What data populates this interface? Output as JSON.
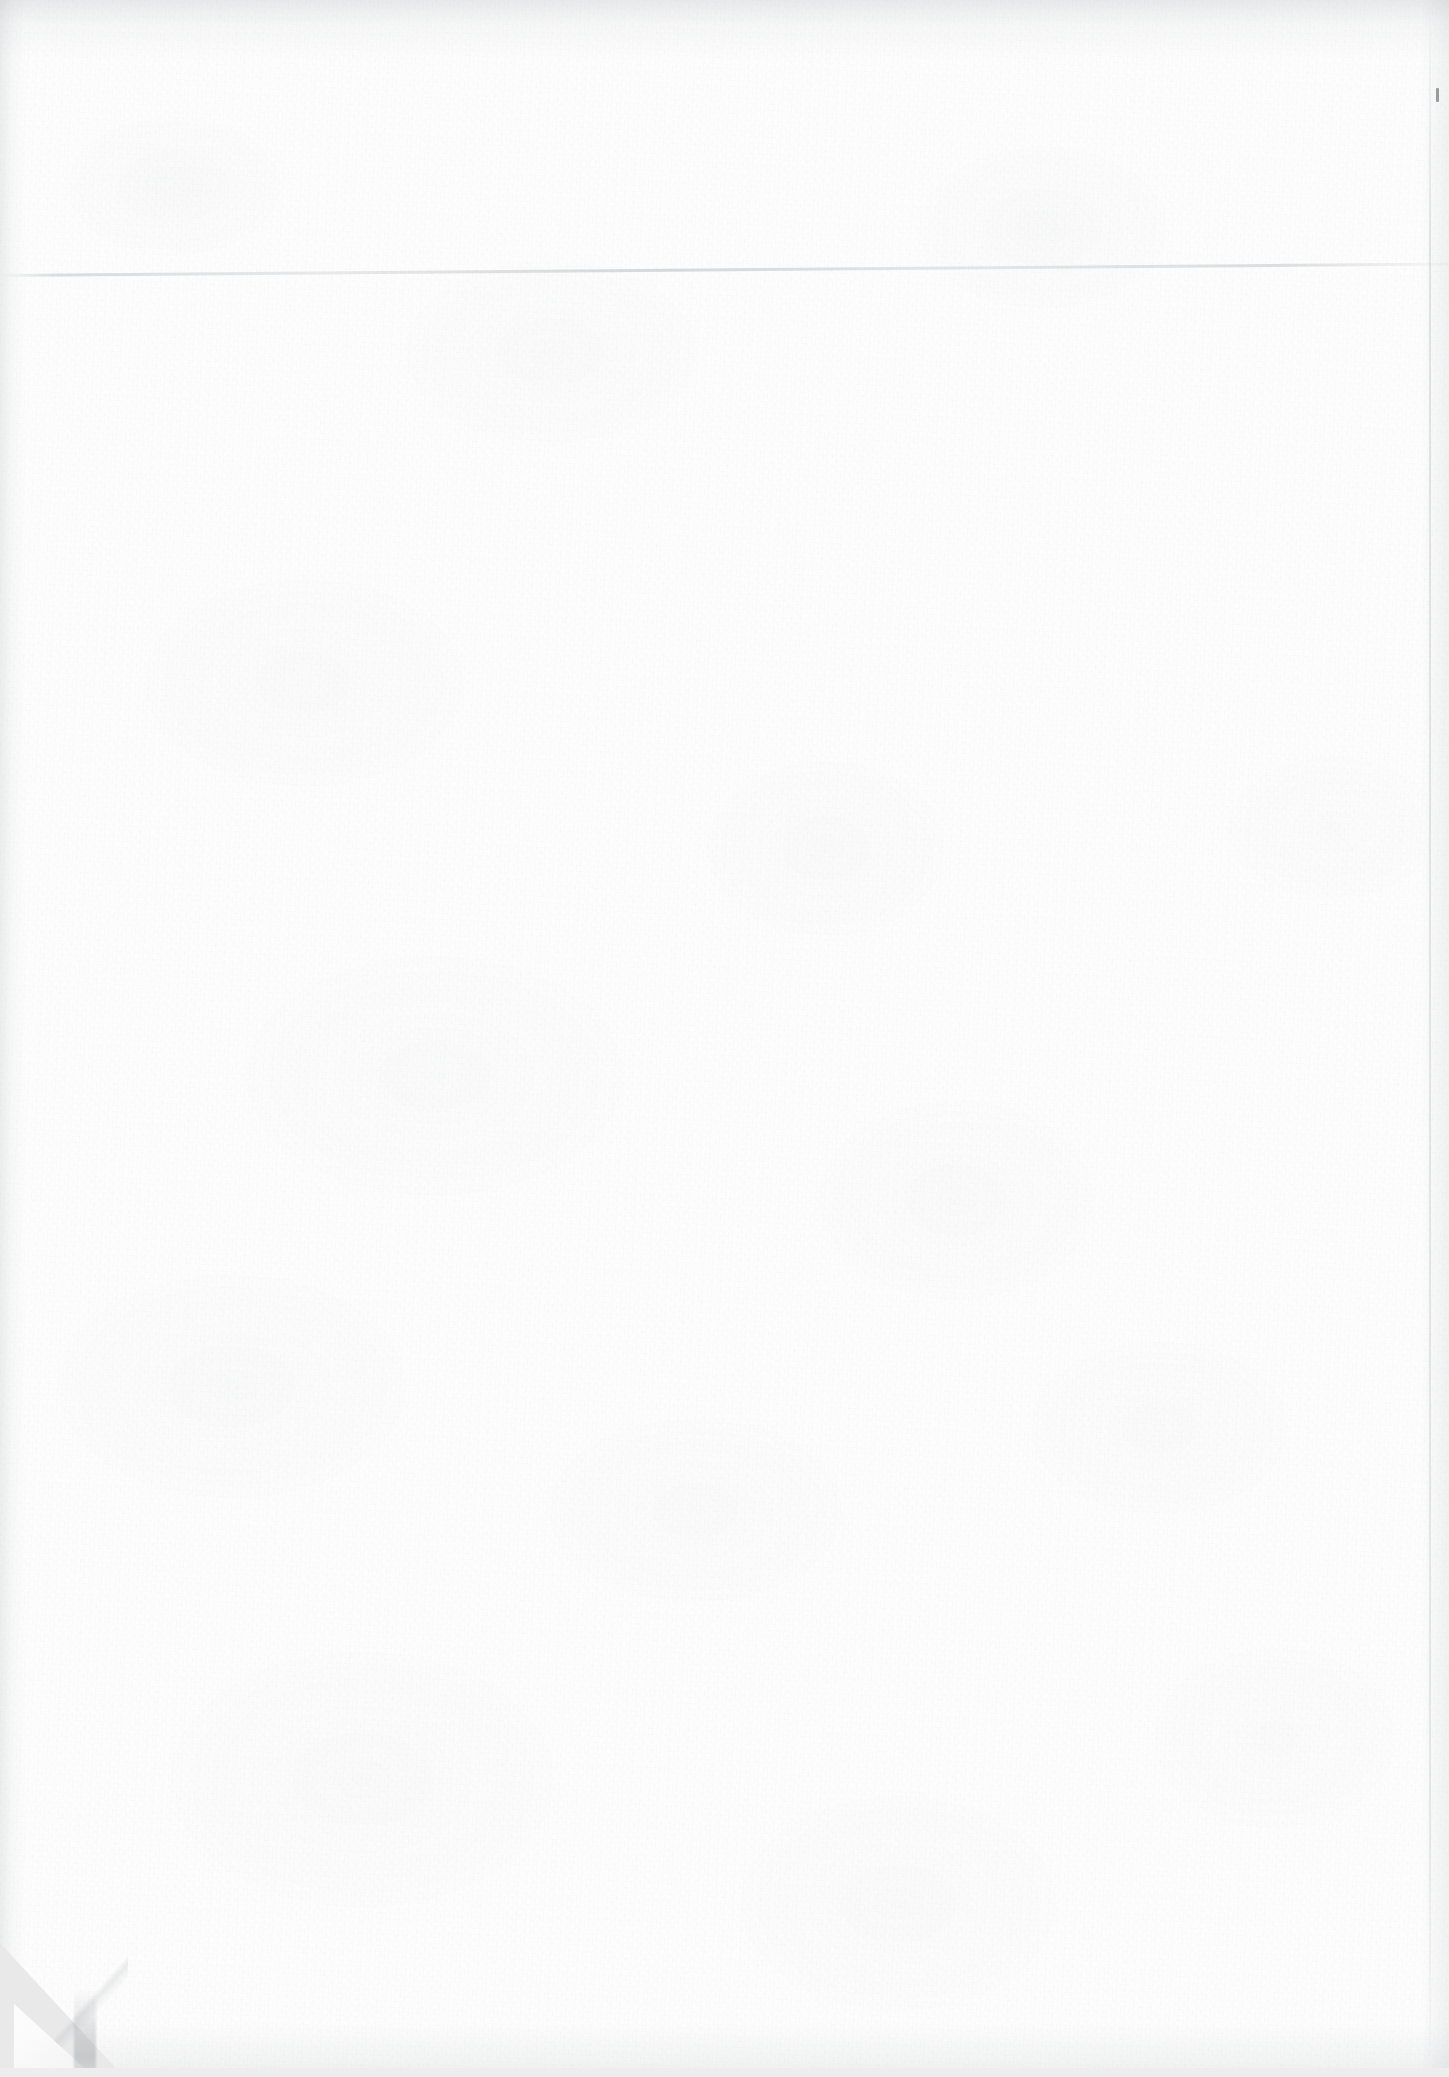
{
  "page": {
    "kind": "scanned-blank-page",
    "visible_text": "",
    "width_px": 1449,
    "height_px": 2077
  },
  "colors": {
    "paper": "#fdfdfd",
    "paper_shadow": "#f2f2f2",
    "scanner_backdrop": "#e9e9e9",
    "backdrop_strip": "#ededed",
    "edge_shade": "#8a9096",
    "speck": "#60646a"
  },
  "artifacts": {
    "grain": {
      "name": "paper-grain-texture",
      "label": ""
    },
    "mottle": {
      "name": "paper-mottling",
      "label": ""
    },
    "crease": {
      "name": "horizontal-paper-crease",
      "label": "",
      "top_px": 274
    },
    "speck": {
      "name": "ink-speck",
      "label": "",
      "left_px": 1436,
      "top_px": 88
    },
    "dog_ear": {
      "name": "folded-bottom-left-corner",
      "label": "",
      "width_px": 124,
      "height_px": 134
    },
    "edges": {
      "top": "",
      "left": "",
      "right": "",
      "bottom": ""
    }
  }
}
